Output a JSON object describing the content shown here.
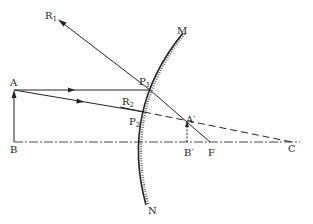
{
  "diagram": {
    "type": "convex-mirror-ray-diagram",
    "labels": {
      "R1": {
        "base": "R",
        "sub": "1"
      },
      "R2": {
        "base": "R",
        "sub": "2"
      },
      "P1": {
        "base": "P",
        "sub": "1"
      },
      "P2": {
        "base": "P",
        "sub": "2"
      },
      "M": "M",
      "N": "N",
      "A": "A",
      "B": "B",
      "A_prime": "A′",
      "B_prime": "B′",
      "F": "F",
      "C": "C"
    },
    "colors": {
      "line": "#222222",
      "background": "#ffffff"
    }
  }
}
